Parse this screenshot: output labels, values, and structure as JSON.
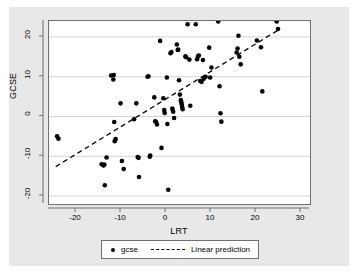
{
  "chart_data": {
    "type": "scatter",
    "title": "",
    "xlabel": "LRT",
    "ylabel": "GCSE",
    "xlim": [
      -26,
      32
    ],
    "ylim": [
      -22,
      24
    ],
    "xticks": [
      -20,
      -10,
      0,
      10,
      20,
      30
    ],
    "yticks": [
      -20,
      -10,
      0,
      10,
      20
    ],
    "xtick_labels": [
      "-20",
      "-10",
      "0",
      "10",
      "20",
      "30"
    ],
    "ytick_labels": [
      "-20",
      "-10",
      "0",
      "10",
      "20"
    ],
    "grid": "horizontal",
    "legend_position": "below-center",
    "marker_color": "#000000",
    "line_color": "#000000",
    "plot_bg": "#ffffff",
    "figure_bg": "#e8e8e8",
    "series": [
      {
        "name": "gcse",
        "type": "scatter",
        "points": [
          [
            -24.2,
            -5.0
          ],
          [
            -23.9,
            -5.6
          ],
          [
            -14.3,
            -12.0
          ],
          [
            -13.7,
            -12.1
          ],
          [
            -13.9,
            -12.3
          ],
          [
            -13.6,
            -17.3
          ],
          [
            -13.2,
            -10.3
          ],
          [
            -12.2,
            10.3
          ],
          [
            -11.6,
            10.4
          ],
          [
            -11.7,
            9.3
          ],
          [
            -11.5,
            -1.4
          ],
          [
            -11.4,
            -6.2
          ],
          [
            -11.2,
            -5.7
          ],
          [
            -10.1,
            3.3
          ],
          [
            -9.8,
            -11.2
          ],
          [
            -9.4,
            -13.2
          ],
          [
            -7.1,
            -0.7
          ],
          [
            -6.6,
            3.3
          ],
          [
            -6.3,
            -10.2
          ],
          [
            -6.1,
            -10.4
          ],
          [
            -6.0,
            -15.2
          ],
          [
            -4.1,
            10.0
          ],
          [
            -3.9,
            10.1
          ],
          [
            -3.6,
            -10.1
          ],
          [
            -3.5,
            -9.8
          ],
          [
            -2.6,
            4.8
          ],
          [
            -2.4,
            -1.2
          ],
          [
            -2.2,
            -1.4
          ],
          [
            -2.0,
            -2.0
          ],
          [
            -1.3,
            19.0
          ],
          [
            -1.0,
            -7.9
          ],
          [
            -0.6,
            4.6
          ],
          [
            -0.4,
            1.6
          ],
          [
            -0.3,
            0.9
          ],
          [
            0.2,
            9.8
          ],
          [
            0.3,
            -1.9
          ],
          [
            0.5,
            -18.4
          ],
          [
            1.0,
            15.9
          ],
          [
            1.2,
            16.2
          ],
          [
            1.4,
            2.0
          ],
          [
            1.5,
            1.6
          ],
          [
            1.6,
            1.2
          ],
          [
            1.8,
            -0.4
          ],
          [
            2.4,
            18.1
          ],
          [
            2.6,
            16.7
          ],
          [
            2.7,
            16.8
          ],
          [
            2.9,
            9.1
          ],
          [
            3.1,
            5.5
          ],
          [
            3.3,
            4.1
          ],
          [
            3.4,
            3.6
          ],
          [
            3.5,
            3.0
          ],
          [
            3.6,
            2.4
          ],
          [
            3.7,
            1.8
          ],
          [
            4.3,
            15.1
          ],
          [
            4.5,
            14.9
          ],
          [
            4.8,
            23.2
          ],
          [
            5.2,
            14.3
          ],
          [
            5.4,
            2.7
          ],
          [
            6.6,
            23.2
          ],
          [
            6.9,
            14.4
          ],
          [
            7.1,
            15.1
          ],
          [
            7.3,
            15.3
          ],
          [
            7.6,
            8.9
          ],
          [
            7.9,
            8.7
          ],
          [
            8.2,
            14.2
          ],
          [
            8.4,
            9.5
          ],
          [
            8.8,
            10.0
          ],
          [
            9.6,
            17.3
          ],
          [
            9.8,
            9.8
          ],
          [
            10.1,
            12.3
          ],
          [
            11.6,
            23.9
          ],
          [
            11.9,
            7.6
          ],
          [
            12.1,
            0.8
          ],
          [
            12.3,
            -1.3
          ],
          [
            15.7,
            16.1
          ],
          [
            15.9,
            17.1
          ],
          [
            16.1,
            20.3
          ],
          [
            16.3,
            15.0
          ],
          [
            16.6,
            13.1
          ],
          [
            20.2,
            19.1
          ],
          [
            21.1,
            17.4
          ],
          [
            21.4,
            6.3
          ],
          [
            24.6,
            23.9
          ],
          [
            24.9,
            22.0
          ]
        ]
      },
      {
        "name": "Linear prediction",
        "type": "line",
        "style": "dashed",
        "endpoints": [
          [
            -24.5,
            -12.6
          ],
          [
            25.2,
            21.9
          ]
        ]
      }
    ],
    "legend_entries": [
      {
        "label": "gcse",
        "marker": "dot"
      },
      {
        "label": "Linear prediction",
        "marker": "dashed-line"
      }
    ]
  }
}
